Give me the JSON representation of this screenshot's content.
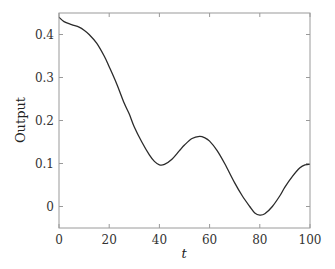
{
  "chart_data": {
    "type": "line",
    "title": "",
    "xlabel": "t",
    "ylabel": "Output",
    "xlim": [
      0,
      100
    ],
    "ylim": [
      -0.05,
      0.45
    ],
    "xticks": [
      0,
      20,
      40,
      60,
      80,
      100
    ],
    "xtick_labels": [
      "0",
      "20",
      "40",
      "60",
      "80",
      "100"
    ],
    "yticks": [
      0,
      0.1,
      0.2,
      0.3,
      0.4
    ],
    "ytick_labels": [
      "0",
      "0.1",
      "0.2",
      "0.3",
      "0.4"
    ],
    "grid": false,
    "legend": null,
    "series": [
      {
        "name": "Output",
        "color": "#2b2b2b",
        "x": [
          0,
          2,
          5,
          8,
          10,
          12,
          15,
          18,
          20,
          23,
          26,
          28,
          30,
          33,
          36,
          38,
          40,
          42,
          45,
          48,
          50,
          53,
          56,
          58,
          60,
          63,
          66,
          70,
          73,
          76,
          78,
          80,
          82,
          85,
          88,
          90,
          93,
          96,
          98,
          100
        ],
        "values": [
          0.44,
          0.43,
          0.423,
          0.417,
          0.41,
          0.4,
          0.38,
          0.35,
          0.325,
          0.285,
          0.24,
          0.215,
          0.185,
          0.15,
          0.12,
          0.105,
          0.097,
          0.098,
          0.11,
          0.13,
          0.143,
          0.158,
          0.163,
          0.16,
          0.152,
          0.13,
          0.1,
          0.055,
          0.025,
          0.0,
          -0.015,
          -0.02,
          -0.017,
          0.0,
          0.025,
          0.045,
          0.07,
          0.09,
          0.097,
          0.098
        ]
      }
    ]
  }
}
